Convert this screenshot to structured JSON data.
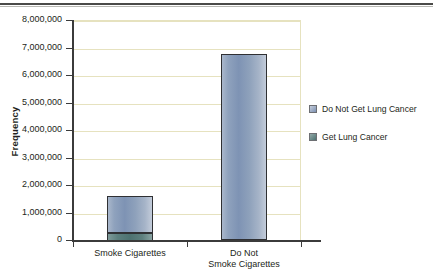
{
  "chart_data": {
    "type": "bar",
    "subtype": "stacked-column",
    "title": "",
    "xlabel": "",
    "ylabel": "Frequency",
    "ylim": [
      0,
      8000000
    ],
    "ytick_step": 1000000,
    "ytick_labels": [
      "8,000,000",
      "7,000,000",
      "6,000,000",
      "5,000,000",
      "4,000,000",
      "3,000,000",
      "2,000,000",
      "1,000,000",
      "0"
    ],
    "ytick_values": [
      8000000,
      7000000,
      6000000,
      5000000,
      4000000,
      3000000,
      2000000,
      1000000,
      0
    ],
    "categories": [
      "Smoke Cigarettes",
      "Do Not Smoke Cigarettes"
    ],
    "category_lines": [
      [
        "Smoke Cigarettes"
      ],
      [
        "Do Not",
        "Smoke Cigarettes"
      ]
    ],
    "series": [
      {
        "name": "Get Lung Cancer",
        "color": "#4d7271",
        "values": [
          300000,
          40000
        ]
      },
      {
        "name": "Do Not Get Lung Cancer",
        "color": "#7e93b4",
        "values": [
          1350000,
          6760000
        ]
      }
    ],
    "totals": [
      1650000,
      6800000
    ],
    "grid": "horizontal",
    "gridline_color": "#e6e2bf",
    "legend_position": "right",
    "legend": [
      {
        "label": "Do Not Get Lung Cancer",
        "swatch": "blue"
      },
      {
        "label": "Get Lung Cancer",
        "swatch": "teal"
      }
    ]
  },
  "axis": {
    "y_title": "Frequency"
  }
}
